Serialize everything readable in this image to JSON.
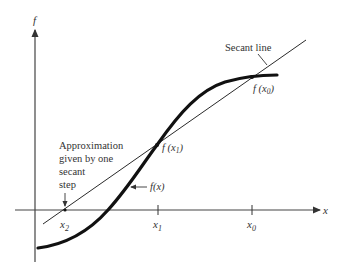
{
  "figure": {
    "axes": {
      "y_label": "f",
      "x_label": "x"
    },
    "ticks": {
      "x2": "x",
      "x2_sub": "2",
      "x1": "x",
      "x1_sub": "1",
      "x0": "x",
      "x0_sub": "0"
    },
    "points": {
      "f_x1": "f (x",
      "f_x1_sub": "1",
      "f_x1_close": ")",
      "f_x0": "f (x",
      "f_x0_sub": "0",
      "f_x0_close": ")"
    },
    "annotations": {
      "secant_line": "Secant line",
      "curve_label": "f(x)",
      "approx_line1": "Approximation",
      "approx_line2": "given by one",
      "approx_line3": "secant",
      "approx_line4": "step"
    },
    "colors": {
      "curve": "#1a1a1a",
      "secant": "#2a2a2a",
      "axes": "#333333"
    }
  }
}
